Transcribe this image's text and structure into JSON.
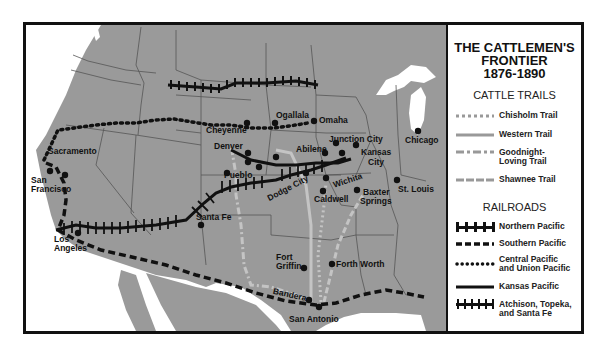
{
  "legend": {
    "title_line1": "THE CATTLEMEN'S",
    "title_line2": "FRONTIER",
    "title_line3": "1876-1890",
    "cattle_trails_heading": "CATTLE TRAILS",
    "cattle_trails": [
      {
        "label": "Chisholm Trail",
        "style": "dotted-gray"
      },
      {
        "label": "Western Trail",
        "style": "solid-gray"
      },
      {
        "label": "Goodnight-Loving Trail",
        "style": "dash-dot-gray"
      },
      {
        "label": "Shawnee Trail",
        "style": "dashed-gray"
      }
    ],
    "railroads_heading": "RAILROADS",
    "railroads": [
      {
        "label": "Northern Pacific",
        "style": "T-ticks"
      },
      {
        "label": "Southern Pacific",
        "style": "dashed-black"
      },
      {
        "label": "Central Pacific and Union Pacific",
        "style": "dotted-black"
      },
      {
        "label": "Kansas Pacific",
        "style": "solid-black"
      },
      {
        "label": "Atchison, Topeka, and Santa Fe",
        "style": "cross-ticks"
      }
    ]
  },
  "cities": {
    "sacramento": "Sacramento",
    "san_francisco_1": "San",
    "san_francisco_2": "Francisco",
    "los_angeles_1": "Los",
    "los_angeles_2": "Angeles",
    "cheyenne": "Cheyenne",
    "ogallala": "Ogallala",
    "omaha": "Omaha",
    "denver": "Denver",
    "abilene": "Abilene",
    "junction_city": "Junction City",
    "kansas_city_1": "Kansas",
    "kansas_city_2": "City",
    "pueblo": "Pueblo",
    "santa_fe": "Santa Fe",
    "dodge_city": "Dodge City",
    "wichita": "Wichita",
    "caldwell": "Caldwell",
    "baxter_springs_1": "Baxter",
    "baxter_springs_2": "Springs",
    "chicago": "Chicago",
    "st_louis": "St. Louis",
    "fort_griffin_1": "Fort",
    "fort_griffin_2": "Griffin",
    "fort_worth": "Forth Worth",
    "bandera": "Bandera",
    "san_antonio": "San Antonio"
  },
  "colors": {
    "land": "#9a9a9a",
    "water": "#ffffff",
    "border": "#555555",
    "trail": "#c4c4c4",
    "rail": "#111111"
  }
}
